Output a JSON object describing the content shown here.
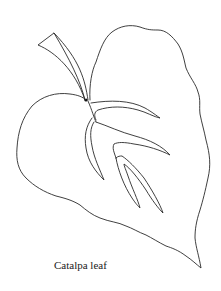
{
  "figure": {
    "caption": "Catalpa leaf",
    "colors": {
      "background": "#ffffff",
      "line": "#2a2a2a",
      "text": "#1a1a1a"
    }
  }
}
